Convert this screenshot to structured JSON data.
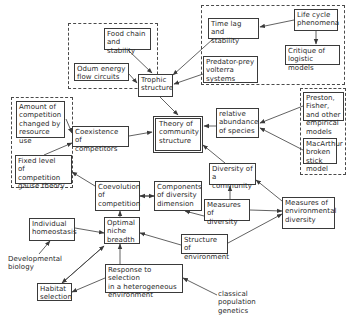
{
  "diagram": {
    "kind": "concept map of community ecology theory",
    "groups": [
      {
        "id": "g_trophic_inputs",
        "x": 68,
        "y": 23,
        "w": 90,
        "h": 66
      },
      {
        "id": "g_population_dynamics",
        "x": 201,
        "y": 5,
        "w": 144,
        "h": 80
      },
      {
        "id": "g_competition_models",
        "x": 11,
        "y": 97,
        "w": 62,
        "h": 91
      },
      {
        "id": "g_abundance_models",
        "x": 300,
        "y": 88,
        "w": 46,
        "h": 87
      }
    ],
    "nodes": [
      {
        "id": "food_chain",
        "label": "Food chain\nand stability",
        "x": 104,
        "y": 28,
        "w": 47,
        "h": 22
      },
      {
        "id": "odum",
        "label": "Odum energy\nflow circuits",
        "x": 74,
        "y": 63,
        "w": 55,
        "h": 18
      },
      {
        "id": "trophic",
        "label": "Trophic\nstructure",
        "x": 138,
        "y": 74,
        "w": 35,
        "h": 23
      },
      {
        "id": "life_cycle",
        "label": "Life cycle\nphenomena",
        "x": 294,
        "y": 9,
        "w": 44,
        "h": 22
      },
      {
        "id": "time_lag",
        "label": "Time lag and\nstability",
        "x": 208,
        "y": 18,
        "w": 51,
        "h": 21
      },
      {
        "id": "critique",
        "label": "Critique of\nlogistic models",
        "x": 285,
        "y": 45,
        "w": 55,
        "h": 20
      },
      {
        "id": "predator_prey",
        "label": "Predator-prey\nvolterra\nsystems",
        "x": 203,
        "y": 56,
        "w": 55,
        "h": 27
      },
      {
        "id": "amount_comp",
        "label": "Amount of\ncompetition\nchanged by\nresource use",
        "x": 16,
        "y": 101,
        "w": 49,
        "h": 37
      },
      {
        "id": "fixed_level",
        "label": "Fixed level\nof competition\ngause theory",
        "x": 15,
        "y": 155,
        "w": 57,
        "h": 29
      },
      {
        "id": "coexistence",
        "label": "Coexistence\nof competitors",
        "x": 72,
        "y": 126,
        "w": 57,
        "h": 21
      },
      {
        "id": "theory",
        "label": "Theory of\ncommunity\nstructure",
        "x": 153,
        "y": 116,
        "w": 50,
        "h": 37,
        "double": true
      },
      {
        "id": "rel_abundance",
        "label": "relative\nabundance\nof species",
        "x": 216,
        "y": 108,
        "w": 43,
        "h": 30
      },
      {
        "id": "preston",
        "label": "Preston, Fisher,\nand other\nempirical models",
        "x": 303,
        "y": 92,
        "w": 41,
        "h": 29
      },
      {
        "id": "macarthur",
        "label": "MacArthur\nbroken stick\nmodel",
        "x": 303,
        "y": 138,
        "w": 34,
        "h": 26
      },
      {
        "id": "diversity_comm",
        "label": "Diversity of\na community",
        "x": 209,
        "y": 163,
        "w": 47,
        "h": 22
      },
      {
        "id": "coevolution",
        "label": "Coevolution\nof\ncompetition",
        "x": 95,
        "y": 181,
        "w": 45,
        "h": 30
      },
      {
        "id": "components",
        "label": "Components\nof diversity\ndimension",
        "x": 154,
        "y": 181,
        "w": 48,
        "h": 30
      },
      {
        "id": "measures_div",
        "label": "Measures of\ndiversity",
        "x": 204,
        "y": 199,
        "w": 46,
        "h": 22
      },
      {
        "id": "measures_env",
        "label": "Measures of\nenvironmental\ndiversity",
        "x": 282,
        "y": 197,
        "w": 53,
        "h": 32
      },
      {
        "id": "homeostasis",
        "label": "Individual\nhomeostasis",
        "x": 29,
        "y": 218,
        "w": 46,
        "h": 23
      },
      {
        "id": "niche",
        "label": "Optimal\nniche\nbreadth",
        "x": 104,
        "y": 217,
        "w": 36,
        "h": 27
      },
      {
        "id": "developmental",
        "label": "Developmental\nbiology",
        "x": 6,
        "y": 254,
        "w": 56,
        "h": 20,
        "plain": true
      },
      {
        "id": "structure_env",
        "label": "Structure of\nenvironment",
        "x": 181,
        "y": 234,
        "w": 47,
        "h": 20
      },
      {
        "id": "habitat",
        "label": "Habitat\nselection",
        "x": 37,
        "y": 283,
        "w": 35,
        "h": 18
      },
      {
        "id": "response",
        "label": "Response to selection\nin a heterogeneous\nenvironment",
        "x": 105,
        "y": 264,
        "w": 78,
        "h": 29
      },
      {
        "id": "classical",
        "label": "classical\npopulation\ngenetics",
        "x": 216,
        "y": 289,
        "w": 44,
        "h": 26,
        "plain": true
      }
    ],
    "edges": [
      {
        "from": "food_chain",
        "to": "trophic",
        "x1": 128,
        "y1": 50,
        "x2": 152,
        "y2": 73
      },
      {
        "from": "odum",
        "to": "trophic",
        "x1": 129,
        "y1": 74,
        "x2": 137,
        "y2": 83
      },
      {
        "from": "time_lag",
        "to": "trophic",
        "x1": 213,
        "y1": 39,
        "x2": 173,
        "y2": 75
      },
      {
        "from": "predator_prey",
        "to": "trophic",
        "x1": 203,
        "y1": 74,
        "x2": 174,
        "y2": 84
      },
      {
        "from": "life_cycle",
        "to": "time_lag",
        "x1": 294,
        "y1": 20,
        "x2": 260,
        "y2": 27
      },
      {
        "from": "life_cycle",
        "to": "critique",
        "x1": 316,
        "y1": 31,
        "x2": 316,
        "y2": 44
      },
      {
        "from": "trophic",
        "to": "theory",
        "x1": 160,
        "y1": 97,
        "x2": 178,
        "y2": 115
      },
      {
        "from": "amount_comp",
        "to": "coexistence",
        "x1": 66,
        "y1": 119,
        "x2": 72,
        "y2": 133
      },
      {
        "from": "fixed_level",
        "to": "coexistence",
        "x1": 44,
        "y1": 155,
        "x2": 72,
        "y2": 143
      },
      {
        "from": "coexistence",
        "to": "theory",
        "x1": 129,
        "y1": 136,
        "x2": 152,
        "y2": 132
      },
      {
        "from": "rel_abundance",
        "to": "theory",
        "x1": 216,
        "y1": 126,
        "x2": 204,
        "y2": 126
      },
      {
        "from": "preston",
        "to": "rel_abundance",
        "x1": 303,
        "y1": 106,
        "x2": 260,
        "y2": 123
      },
      {
        "from": "macarthur",
        "to": "rel_abundance",
        "x1": 303,
        "y1": 150,
        "x2": 260,
        "y2": 128
      },
      {
        "from": "diversity_comm",
        "to": "theory",
        "x1": 225,
        "y1": 163,
        "x2": 203,
        "y2": 145
      },
      {
        "from": "coevolution",
        "to": "fixed_level",
        "x1": 95,
        "y1": 186,
        "x2": 72,
        "y2": 172
      },
      {
        "from": "components",
        "to": "coevolution",
        "x1": 154,
        "y1": 196,
        "x2": 140,
        "y2": 196,
        "both": true
      },
      {
        "from": "measures_div",
        "to": "diversity_comm",
        "x1": 230,
        "y1": 199,
        "x2": 230,
        "y2": 186
      },
      {
        "from": "measures_div",
        "to": "components",
        "x1": 204,
        "y1": 216,
        "x2": 185,
        "y2": 211
      },
      {
        "from": "measures_div",
        "to": "measures_env",
        "x1": 250,
        "y1": 210,
        "x2": 282,
        "y2": 211
      },
      {
        "from": "measures_env",
        "to": "diversity_comm",
        "x1": 282,
        "y1": 201,
        "x2": 256,
        "y2": 180
      },
      {
        "from": "niche",
        "to": "coevolution",
        "x1": 120,
        "y1": 217,
        "x2": 120,
        "y2": 211
      },
      {
        "from": "homeostasis",
        "to": "niche",
        "x1": 75,
        "y1": 228,
        "x2": 104,
        "y2": 233
      },
      {
        "from": "developmental",
        "to": "homeostasis",
        "x1": 39,
        "y1": 254,
        "x2": 50,
        "y2": 241
      },
      {
        "from": "structure_env",
        "to": "niche",
        "x1": 181,
        "y1": 245,
        "x2": 140,
        "y2": 233
      },
      {
        "from": "structure_env",
        "to": "measures_env",
        "x1": 228,
        "y1": 243,
        "x2": 282,
        "y2": 214
      },
      {
        "from": "response",
        "to": "niche",
        "x1": 120,
        "y1": 264,
        "x2": 120,
        "y2": 244
      },
      {
        "from": "response",
        "to": "habitat",
        "x1": 105,
        "y1": 278,
        "x2": 72,
        "y2": 292
      },
      {
        "from": "habitat",
        "to": "niche",
        "x1": 62,
        "y1": 283,
        "x2": 104,
        "y2": 246,
        "both": true
      },
      {
        "from": "classical",
        "to": "response",
        "x1": 217,
        "y1": 295,
        "x2": 183,
        "y2": 278
      }
    ]
  }
}
